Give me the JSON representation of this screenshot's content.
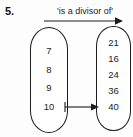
{
  "question": {
    "number": "5."
  },
  "relation": {
    "label": "'is a divisor of'",
    "direction_icon": "right-arrow-icon"
  },
  "domain_set": {
    "name": "divisors",
    "elements": [
      "7",
      "8",
      "9",
      "10"
    ]
  },
  "codomain_set": {
    "name": "multiples",
    "elements": [
      "21",
      "16",
      "24",
      "36",
      "40"
    ]
  },
  "mappings": [
    {
      "from": "10",
      "to": "40",
      "icon": "right-arrow-icon"
    }
  ],
  "colors": {
    "background": "#fdfdfd",
    "stroke": "#1c1c1c",
    "text": "#1a1a1a"
  }
}
